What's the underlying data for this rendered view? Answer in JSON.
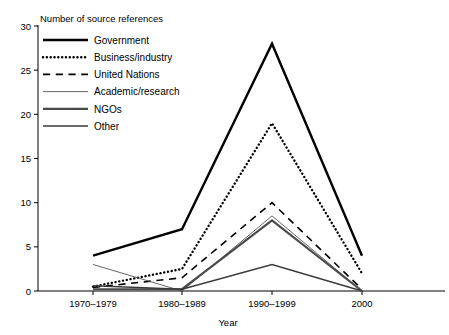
{
  "chart_data": {
    "type": "line",
    "title": "",
    "ylabel": "Number of source references",
    "xlabel": "Year",
    "categories": [
      "1970–1979",
      "1980–1989",
      "1990–1999",
      "2000"
    ],
    "ylim": [
      0,
      30
    ],
    "yticks": [
      0,
      5,
      10,
      15,
      20,
      25,
      30
    ],
    "ytick_labels": [
      "0",
      "5",
      "10",
      "15",
      "20",
      "25",
      "30"
    ],
    "grid": false,
    "legend_position": "top-left",
    "series": [
      {
        "name": "Government",
        "values": [
          4,
          7,
          28,
          4
        ],
        "style": "solid",
        "width": 2.4,
        "color": "#000000"
      },
      {
        "name": "Business/industry",
        "values": [
          0.5,
          2.5,
          19,
          2
        ],
        "style": "dotted",
        "width": 2.4,
        "color": "#000000"
      },
      {
        "name": "United Nations",
        "values": [
          0.4,
          1.5,
          10,
          0.2
        ],
        "style": "dashdot",
        "width": 1.6,
        "color": "#000000"
      },
      {
        "name": "Academic/research",
        "values": [
          3,
          0,
          8.5,
          0
        ],
        "style": "solid",
        "width": 0.9,
        "color": "#555555"
      },
      {
        "name": "NGOs",
        "values": [
          0.2,
          0.2,
          8,
          0
        ],
        "style": "solid",
        "width": 2.2,
        "color": "#4a4a4a"
      },
      {
        "name": "Other",
        "values": [
          0.6,
          0.2,
          3,
          0
        ],
        "style": "solid",
        "width": 1.4,
        "color": "#3a3a3a"
      }
    ]
  },
  "legend": {
    "items": [
      {
        "label": "Government"
      },
      {
        "label": "Business/industry"
      },
      {
        "label": "United Nations"
      },
      {
        "label": "Academic/research"
      },
      {
        "label": "NGOs"
      },
      {
        "label": "Other"
      }
    ]
  },
  "axes": {
    "y_axis_title": "Number of source references",
    "x_axis_title": "Year"
  }
}
